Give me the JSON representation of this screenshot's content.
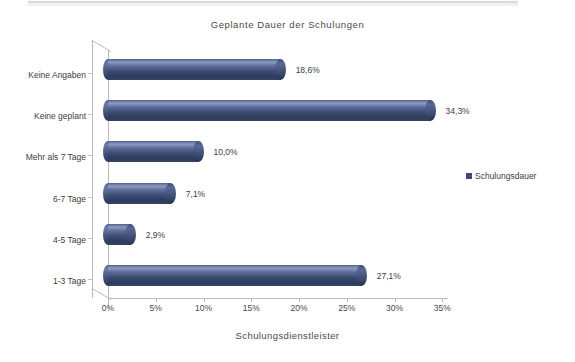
{
  "chart_data": {
    "type": "bar",
    "orientation": "horizontal",
    "title": "Geplante Dauer der Schulungen",
    "xlabel": "Schulungsdienstleister",
    "ylabel": "",
    "categories": [
      "1-3 Tage",
      "4-5 Tage",
      "6-7 Tage",
      "Mehr als 7 Tage",
      "Keine geplant",
      "Keine Angaben"
    ],
    "values": [
      27.1,
      2.9,
      7.1,
      10.0,
      34.3,
      18.6
    ],
    "value_labels": [
      "27,1%",
      "2,9%",
      "7,1%",
      "10,0%",
      "34,3%",
      "18,6%"
    ],
    "xlim": [
      0,
      35
    ],
    "xticks": [
      0,
      5,
      10,
      15,
      20,
      25,
      30,
      35
    ],
    "xtick_labels": [
      "0%",
      "5%",
      "10%",
      "15%",
      "20%",
      "25%",
      "30%",
      "35%"
    ],
    "grid": false,
    "legend_position": "right",
    "series": [
      {
        "name": "Schulungsdauer",
        "color": "#404878",
        "values": [
          27.1,
          2.9,
          7.1,
          10.0,
          34.3,
          18.6
        ]
      }
    ]
  },
  "legend": {
    "entries": [
      {
        "label": "Schulungsdauer",
        "color": "#404878"
      }
    ]
  }
}
